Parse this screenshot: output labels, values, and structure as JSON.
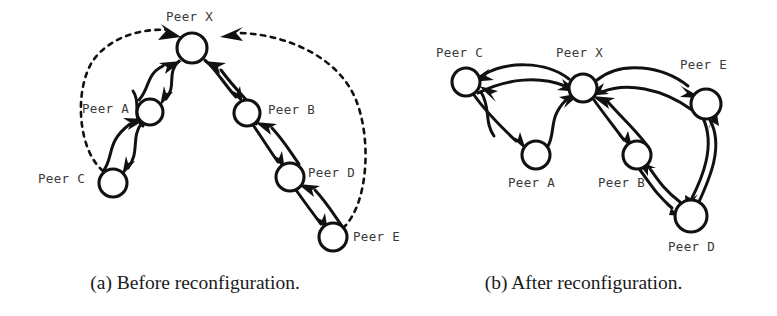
{
  "figure": {
    "panels": [
      {
        "id": "before",
        "caption": "(a) Before reconfiguration.",
        "nodes": [
          {
            "id": "X",
            "label": "Peer X",
            "cx": 192,
            "cy": 48,
            "r": 15,
            "label_x": 166,
            "label_y": 10
          },
          {
            "id": "A",
            "label": "Peer A",
            "cx": 150,
            "cy": 112,
            "r": 13,
            "label_x": 82,
            "label_y": 102
          },
          {
            "id": "B",
            "label": "Peer B",
            "cx": 247,
            "cy": 113,
            "r": 13,
            "label_x": 268,
            "label_y": 103
          },
          {
            "id": "C",
            "label": "Peer C",
            "cx": 113,
            "cy": 183,
            "r": 14,
            "label_x": 38,
            "label_y": 172
          },
          {
            "id": "D",
            "label": "Peer D",
            "cx": 290,
            "cy": 177,
            "r": 14,
            "label_x": 308,
            "label_y": 166
          },
          {
            "id": "E",
            "label": "Peer E",
            "cx": 333,
            "cy": 237,
            "r": 14,
            "label_x": 353,
            "label_y": 230
          }
        ],
        "edges": [
          {
            "from": "X",
            "to": "A",
            "style": "solid",
            "direction": "both"
          },
          {
            "from": "X",
            "to": "B",
            "style": "solid",
            "direction": "both"
          },
          {
            "from": "A",
            "to": "C",
            "style": "solid",
            "direction": "both"
          },
          {
            "from": "B",
            "to": "D",
            "style": "solid",
            "direction": "both"
          },
          {
            "from": "D",
            "to": "E",
            "style": "solid",
            "direction": "both"
          },
          {
            "from": "C",
            "to": "X",
            "style": "dashed",
            "direction": "to"
          },
          {
            "from": "E",
            "to": "X",
            "style": "dashed",
            "direction": "to"
          }
        ]
      },
      {
        "id": "after",
        "caption": "(b) After reconfiguration.",
        "nodes": [
          {
            "id": "C",
            "label": "Peer C",
            "cx": 76,
            "cy": 82,
            "r": 14,
            "label_x": 46,
            "label_y": 46
          },
          {
            "id": "X",
            "label": "Peer X",
            "cx": 193,
            "cy": 88,
            "r": 14,
            "label_x": 166,
            "label_y": 46
          },
          {
            "id": "E",
            "label": "Peer E",
            "cx": 316,
            "cy": 104,
            "r": 15,
            "label_x": 290,
            "label_y": 58
          },
          {
            "id": "A",
            "label": "Peer A",
            "cx": 146,
            "cy": 155,
            "r": 14,
            "label_x": 118,
            "label_y": 176
          },
          {
            "id": "B",
            "label": "Peer B",
            "cx": 247,
            "cy": 155,
            "r": 14,
            "label_x": 208,
            "label_y": 176
          },
          {
            "id": "D",
            "label": "Peer D",
            "cx": 301,
            "cy": 216,
            "r": 16,
            "label_x": 278,
            "label_y": 240
          }
        ],
        "edges": [
          {
            "from": "X",
            "to": "C",
            "style": "solid",
            "direction": "both"
          },
          {
            "from": "X",
            "to": "E",
            "style": "solid",
            "direction": "both"
          },
          {
            "from": "C",
            "to": "A",
            "style": "solid",
            "direction": "both"
          },
          {
            "from": "A",
            "to": "X",
            "style": "solid",
            "direction": "both"
          },
          {
            "from": "X",
            "to": "B",
            "style": "solid",
            "direction": "both"
          },
          {
            "from": "B",
            "to": "D",
            "style": "solid",
            "direction": "both"
          },
          {
            "from": "D",
            "to": "E",
            "style": "solid",
            "direction": "both"
          }
        ]
      }
    ]
  },
  "colors": {
    "ink": "#111111",
    "label_ink": "#3a3a3a",
    "background": "#ffffff"
  }
}
